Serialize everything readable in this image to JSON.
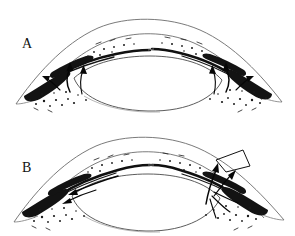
{
  "figure": {
    "background_color": "#ffffff",
    "ink_color": "#111111",
    "width": 295,
    "height": 236,
    "style": "grayscale pen-and-ink anatomical line drawing, halftone stipple shading"
  },
  "panels": [
    {
      "id": "panel-a",
      "label": "A",
      "label_x": 22,
      "label_y": 48,
      "description": "Normal anterior chamber angle with aqueous outflow arrows passing through trabecular meshwork on both sides",
      "structures": [
        "cornea outer surface",
        "cornea inner surface",
        "limbus",
        "sclera",
        "iris",
        "anterior chamber angle",
        "trabecular meshwork",
        "ciliary body",
        "lens"
      ],
      "arrows": [
        {
          "name": "aqueous-outflow-left",
          "direction": "up-and-out",
          "side": "left"
        },
        {
          "name": "aqueous-outflow-left-secondary",
          "direction": "up",
          "side": "left"
        },
        {
          "name": "aqueous-outflow-right",
          "direction": "up-and-out",
          "side": "right"
        },
        {
          "name": "aqueous-outflow-right-secondary",
          "direction": "up",
          "side": "right"
        }
      ],
      "has_incision": false
    },
    {
      "id": "panel-b",
      "label": "B",
      "label_x": 22,
      "label_y": 172,
      "description": "Anterior chamber with surgical wedge incision at right limbus and redirected aqueous flow arrows",
      "structures": [
        "cornea outer surface",
        "cornea inner surface",
        "limbus",
        "sclera",
        "iris",
        "anterior chamber angle",
        "trabecular meshwork",
        "ciliary body",
        "lens",
        "surgical wedge incision"
      ],
      "arrows": [
        {
          "name": "aqueous-flow-leftward",
          "direction": "left along iris",
          "side": "left"
        },
        {
          "name": "aqueous-flow-into-incision",
          "direction": "up toward incision",
          "side": "right"
        },
        {
          "name": "aqueous-flow-up-right",
          "direction": "up-right",
          "side": "right"
        },
        {
          "name": "aqueous-flow-fan-right",
          "direction": "radiating",
          "side": "right"
        }
      ],
      "has_incision": true,
      "incision": {
        "name": "surgical-wedge-incision",
        "location": "right limbus",
        "shape": "wedge / scleral flap"
      }
    }
  ]
}
